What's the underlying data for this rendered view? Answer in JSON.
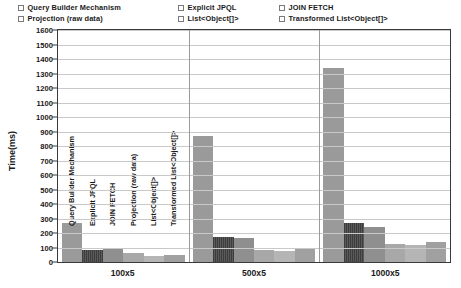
{
  "chart_data": {
    "type": "bar",
    "title": "",
    "xlabel": "",
    "ylabel": "Time(ms)",
    "ylim": [
      0,
      1600
    ],
    "ytick_step": 100,
    "grid": true,
    "legend_position": "top",
    "categories": [
      "100x5",
      "500x5",
      "1000x5"
    ],
    "series": [
      {
        "name": "Query Builder Mechanism",
        "color": "#9a9a9a",
        "values": [
          270,
          870,
          1340
        ]
      },
      {
        "name": "Explicit JPQL",
        "color": "#4a4a4a",
        "values": [
          85,
          175,
          270
        ]
      },
      {
        "name": "JOIN FETCH",
        "color": "#8f8f8f",
        "values": [
          95,
          165,
          240
        ]
      },
      {
        "name": "Projection (raw data)",
        "color": "#a8a8a8",
        "values": [
          60,
          80,
          125
        ]
      },
      {
        "name": "List<Object[]>",
        "color": "#b5b5b5",
        "values": [
          40,
          75,
          120
        ]
      },
      {
        "name": "Transformed List<Object[]>",
        "color": "#a0a0a0",
        "values": [
          45,
          90,
          135
        ]
      }
    ],
    "ytick_labels": [
      "1600",
      "1500",
      "1400",
      "1300",
      "1200",
      "1100",
      "1000",
      "900",
      "800",
      "700",
      "600",
      "500",
      "400",
      "300",
      "200",
      "100",
      "0"
    ]
  },
  "legend": {
    "items": [
      {
        "label": "Query Builder Mechanism"
      },
      {
        "label": "Explicit JPQL"
      },
      {
        "label": "JOIN FETCH"
      },
      {
        "label": "Projection (raw data)"
      },
      {
        "label": "List<Object[]>"
      },
      {
        "label": "Transformed List<Object[]>"
      }
    ]
  }
}
